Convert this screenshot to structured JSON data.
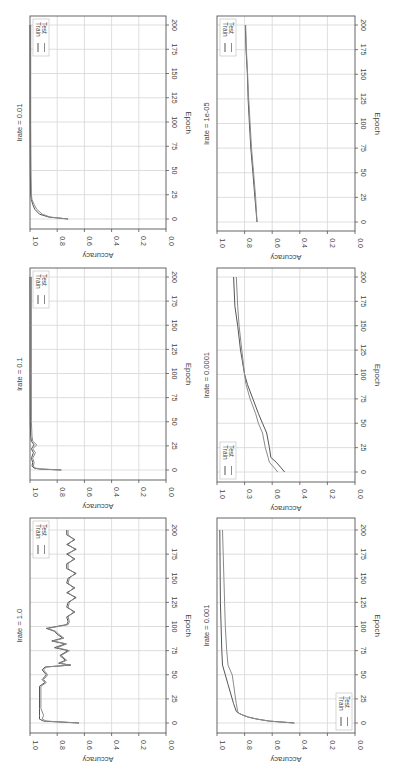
{
  "figure": {
    "layout": "2 columns x 3 rows, each subplot rotated 90 degrees clockwise (epoch axis vertical on right, accuracy axis along bottom reversed)",
    "colors": {
      "train": "#555555",
      "test": "#8a8a8a",
      "grid": "#d6d6d6",
      "frame": "#555555"
    }
  },
  "chart_data": [
    {
      "type": "line",
      "title": "lrate = 0.01",
      "xlabel": "Epoch",
      "ylabel": "Accuracy",
      "xlim": [
        -8,
        208
      ],
      "ylim": [
        0.0,
        1.0
      ],
      "xticks": [
        "0",
        "25",
        "50",
        "75",
        "100",
        "125",
        "150",
        "175",
        "200"
      ],
      "yticks": [
        "0.0",
        "0.2",
        "0.4",
        "0.6",
        "0.8",
        "1.0"
      ],
      "grid": true,
      "legend": [
        "Train",
        "Test"
      ],
      "legend_position": "upper left (rotated: top-left)",
      "series": [
        {
          "name": "Train",
          "x": [
            0,
            2,
            5,
            10,
            15,
            20,
            25,
            50,
            100,
            150,
            200
          ],
          "values": [
            0.72,
            0.86,
            0.93,
            0.965,
            0.98,
            0.99,
            0.995,
            0.998,
            0.999,
            0.999,
            1.0
          ]
        },
        {
          "name": "Test",
          "x": [
            0,
            2,
            5,
            10,
            15,
            20,
            25,
            50,
            100,
            150,
            200
          ],
          "values": [
            0.72,
            0.85,
            0.91,
            0.95,
            0.97,
            0.985,
            0.99,
            0.993,
            0.995,
            0.995,
            0.995
          ]
        }
      ]
    },
    {
      "type": "line",
      "title": "lrate = 0.1",
      "xlabel": "Epoch",
      "ylabel": "Accuracy",
      "xlim": [
        -8,
        208
      ],
      "ylim": [
        0.0,
        1.0
      ],
      "xticks": [
        "0",
        "25",
        "50",
        "75",
        "100",
        "125",
        "150",
        "175",
        "200"
      ],
      "yticks": [
        "0.0",
        "0.2",
        "0.4",
        "0.6",
        "0.8",
        "1.0"
      ],
      "grid": true,
      "legend": [
        "Train",
        "Test"
      ],
      "legend_position": "upper left (rotated: top-left)",
      "series": [
        {
          "name": "Train",
          "x": [
            0,
            1,
            2,
            4,
            8,
            12,
            18,
            22,
            26,
            30,
            35,
            50,
            100,
            150,
            200
          ],
          "values": [
            0.77,
            0.93,
            0.97,
            0.985,
            0.98,
            0.99,
            0.975,
            0.99,
            0.97,
            0.99,
            0.995,
            0.998,
            0.999,
            0.999,
            1.0
          ]
        },
        {
          "name": "Test",
          "x": [
            0,
            1,
            2,
            4,
            8,
            12,
            18,
            22,
            26,
            30,
            35,
            50,
            100,
            150,
            200
          ],
          "values": [
            0.77,
            0.92,
            0.96,
            0.975,
            0.97,
            0.98,
            0.96,
            0.98,
            0.95,
            0.98,
            0.985,
            0.99,
            0.99,
            0.99,
            0.99
          ]
        }
      ]
    },
    {
      "type": "line",
      "title": "lrate = 1.0",
      "xlabel": "Epoch",
      "ylabel": "Accuracy",
      "xlim": [
        -8,
        208
      ],
      "ylim": [
        0.0,
        1.0
      ],
      "xticks": [
        "0",
        "25",
        "50",
        "75",
        "100",
        "125",
        "150",
        "175",
        "200"
      ],
      "yticks": [
        "0.0",
        "0.2",
        "0.4",
        "0.6",
        "0.8",
        "1.0"
      ],
      "grid": true,
      "legend": [
        "Train",
        "Test"
      ],
      "legend_position": "upper left (rotated: top-left)",
      "series": [
        {
          "name": "Train",
          "x": [
            0,
            2,
            4,
            8,
            15,
            25,
            38,
            42,
            45,
            50,
            55,
            58,
            60,
            62,
            65,
            70,
            75,
            78,
            82,
            85,
            88,
            92,
            95,
            98,
            102,
            105,
            110,
            115,
            120,
            125,
            130,
            135,
            140,
            145,
            150,
            155,
            160,
            165,
            170,
            175,
            180,
            185,
            190,
            195,
            200
          ],
          "values": [
            0.64,
            0.9,
            0.93,
            0.93,
            0.93,
            0.93,
            0.93,
            0.89,
            0.91,
            0.88,
            0.91,
            0.89,
            0.7,
            0.79,
            0.74,
            0.78,
            0.72,
            0.82,
            0.74,
            0.84,
            0.76,
            0.8,
            0.82,
            0.88,
            0.73,
            0.72,
            0.73,
            0.67,
            0.73,
            0.72,
            0.66,
            0.73,
            0.67,
            0.73,
            0.72,
            0.66,
            0.73,
            0.73,
            0.67,
            0.73,
            0.66,
            0.73,
            0.67,
            0.73,
            0.73
          ]
        },
        {
          "name": "Test",
          "x": [
            0,
            2,
            4,
            8,
            15,
            25,
            38,
            42,
            45,
            50,
            55,
            58,
            60,
            62,
            65,
            70,
            75,
            78,
            82,
            85,
            88,
            92,
            95,
            98,
            102,
            105,
            110,
            115,
            120,
            125,
            130,
            135,
            140,
            145,
            150,
            155,
            160,
            165,
            170,
            175,
            180,
            185,
            190,
            195,
            200
          ],
          "values": [
            0.64,
            0.88,
            0.91,
            0.9,
            0.92,
            0.92,
            0.92,
            0.88,
            0.9,
            0.87,
            0.9,
            0.88,
            0.71,
            0.78,
            0.73,
            0.77,
            0.71,
            0.8,
            0.73,
            0.83,
            0.75,
            0.79,
            0.81,
            0.87,
            0.72,
            0.71,
            0.72,
            0.68,
            0.72,
            0.71,
            0.67,
            0.72,
            0.68,
            0.72,
            0.71,
            0.67,
            0.72,
            0.72,
            0.68,
            0.72,
            0.67,
            0.72,
            0.68,
            0.72,
            0.72
          ]
        }
      ]
    },
    {
      "type": "line",
      "title": "lrate = 1e-05",
      "xlabel": "Epoch",
      "ylabel": "Accuracy",
      "xlim": [
        -8,
        208
      ],
      "ylim": [
        0.0,
        1.0
      ],
      "xticks": [
        "0",
        "25",
        "50",
        "75",
        "100",
        "125",
        "150",
        "175",
        "200"
      ],
      "yticks": [
        "0.0",
        "0.2",
        "0.4",
        "0.6",
        "0.8",
        "1.0"
      ],
      "grid": true,
      "legend": [
        "Train",
        "Test"
      ],
      "legend_position": "upper left (rotated: top-left)",
      "series": [
        {
          "name": "Train",
          "x": [
            0,
            25,
            50,
            75,
            100,
            125,
            150,
            175,
            200
          ],
          "values": [
            0.71,
            0.725,
            0.74,
            0.755,
            0.765,
            0.775,
            0.78,
            0.79,
            0.795
          ]
        },
        {
          "name": "Test",
          "x": [
            0,
            25,
            50,
            75,
            100,
            125,
            150,
            175,
            200
          ],
          "values": [
            0.71,
            0.72,
            0.735,
            0.75,
            0.76,
            0.77,
            0.778,
            0.787,
            0.792
          ]
        }
      ]
    },
    {
      "type": "line",
      "title": "lrate = 0.0001",
      "xlabel": "Epoch",
      "ylabel": "Accuracy",
      "xlim": [
        -8,
        208
      ],
      "ylim": [
        0.0,
        1.0
      ],
      "xticks": [
        "0",
        "25",
        "50",
        "75",
        "100",
        "125",
        "150",
        "175",
        "200"
      ],
      "yticks": [
        "0.0",
        "0.2",
        "0.4",
        "0.6",
        "0.3",
        "1.0"
      ],
      "grid": true,
      "legend": [
        "Train",
        "Test"
      ],
      "legend_position": "lower left (rotated: bottom-left)",
      "series": [
        {
          "name": "Train",
          "x": [
            0,
            5,
            10,
            15,
            25,
            40,
            50,
            60,
            75,
            90,
            100,
            125,
            150,
            170,
            200
          ],
          "values": [
            0.51,
            0.54,
            0.57,
            0.61,
            0.62,
            0.64,
            0.67,
            0.7,
            0.74,
            0.78,
            0.8,
            0.83,
            0.85,
            0.87,
            0.88
          ]
        },
        {
          "name": "Test",
          "x": [
            0,
            5,
            10,
            15,
            25,
            40,
            50,
            60,
            75,
            90,
            100,
            125,
            150,
            170,
            200
          ],
          "values": [
            0.56,
            0.59,
            0.62,
            0.63,
            0.65,
            0.67,
            0.7,
            0.72,
            0.76,
            0.79,
            0.8,
            0.82,
            0.84,
            0.85,
            0.86
          ]
        }
      ]
    },
    {
      "type": "line",
      "title": "lrate = 0.001",
      "xlabel": "Epoch",
      "ylabel": "Accuracy",
      "xlim": [
        -8,
        208
      ],
      "ylim": [
        0.0,
        1.0
      ],
      "xticks": [
        "0",
        "25",
        "50",
        "75",
        "100",
        "125",
        "150",
        "175",
        "200"
      ],
      "yticks": [
        "0.0",
        "0.2",
        "0.4",
        "0.6",
        "0.8",
        "1.0"
      ],
      "grid": true,
      "legend": [
        "Train",
        "Test"
      ],
      "legend_position": "lower right (rotated: bottom-right)",
      "series": [
        {
          "name": "Train",
          "x": [
            0,
            2,
            4,
            6,
            8,
            10,
            12,
            20,
            30,
            40,
            50,
            60,
            75,
            100,
            125,
            150,
            175,
            200
          ],
          "values": [
            0.44,
            0.62,
            0.71,
            0.77,
            0.81,
            0.84,
            0.86,
            0.88,
            0.9,
            0.92,
            0.94,
            0.96,
            0.965,
            0.97,
            0.975,
            0.977,
            0.978,
            0.98
          ]
        },
        {
          "name": "Test",
          "x": [
            0,
            2,
            4,
            6,
            8,
            10,
            12,
            20,
            30,
            40,
            50,
            60,
            75,
            100,
            125,
            150,
            175,
            200
          ],
          "values": [
            0.44,
            0.62,
            0.71,
            0.77,
            0.81,
            0.84,
            0.85,
            0.86,
            0.87,
            0.88,
            0.89,
            0.92,
            0.93,
            0.94,
            0.945,
            0.95,
            0.955,
            0.96
          ]
        }
      ]
    }
  ]
}
